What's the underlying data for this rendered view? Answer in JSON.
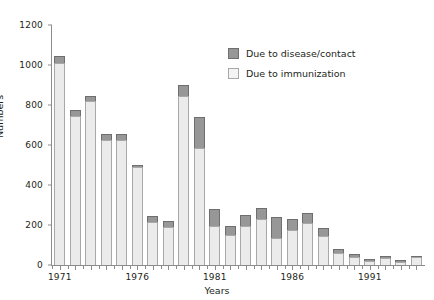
{
  "chart_data": {
    "type": "bar",
    "subtype": "stacked",
    "title": "",
    "xlabel": "Years",
    "ylabel": "Numbers",
    "ylim": [
      0,
      1200
    ],
    "ytick_step": 200,
    "yticks": [
      0,
      200,
      400,
      600,
      800,
      1000,
      1200
    ],
    "grid": false,
    "legend_position": "top-right",
    "categories": [
      "1971",
      "1972",
      "1973",
      "1974",
      "1975",
      "1976",
      "1977",
      "1978",
      "1979",
      "1980",
      "1981",
      "1982",
      "1983",
      "1984",
      "1985",
      "1986",
      "1987",
      "1988",
      "1989",
      "1990",
      "1991",
      "1992",
      "1993",
      "1994"
    ],
    "xtick_labels": [
      "1971",
      "1976",
      "1981",
      "1986",
      "1991"
    ],
    "series": [
      {
        "name": "Due to immunization",
        "color": "#ebebeb",
        "values": [
          1010,
          745,
          820,
          625,
          625,
          490,
          215,
          190,
          845,
          585,
          195,
          150,
          195,
          230,
          135,
          175,
          210,
          145,
          60,
          40,
          20,
          35,
          15,
          40
        ]
      },
      {
        "name": "Due to disease/contact",
        "color": "#979797",
        "values": [
          35,
          30,
          25,
          30,
          30,
          10,
          30,
          30,
          55,
          155,
          85,
          45,
          55,
          55,
          105,
          55,
          50,
          40,
          20,
          15,
          10,
          10,
          10,
          5
        ]
      }
    ],
    "totals": [
      1045,
      775,
      845,
      655,
      655,
      500,
      245,
      220,
      900,
      740,
      280,
      195,
      250,
      285,
      240,
      230,
      260,
      185,
      80,
      55,
      30,
      45,
      25,
      45
    ]
  },
  "axis": {
    "y_title": "Numbers",
    "x_title": "Years"
  },
  "legend": {
    "items": [
      {
        "label": "Due to disease/contact",
        "swatch": "dark"
      },
      {
        "label": "Due to immunization",
        "swatch": "light"
      }
    ]
  }
}
